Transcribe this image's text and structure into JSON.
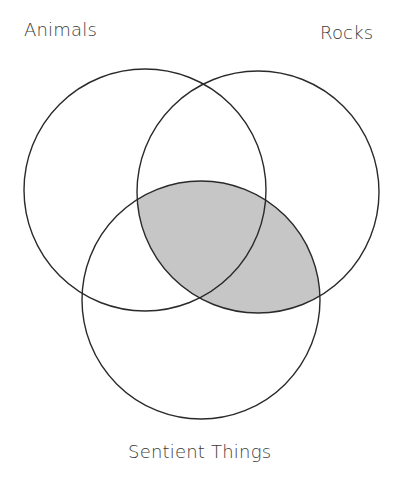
{
  "diagram": {
    "type": "venn",
    "sets": [
      {
        "id": "animals",
        "label": "Animals",
        "cx": 145,
        "cy": 190,
        "r": 121
      },
      {
        "id": "rocks",
        "label": "Rocks",
        "cx": 258,
        "cy": 192,
        "r": 121
      },
      {
        "id": "sentient",
        "label": "Sentient Things",
        "cx": 201,
        "cy": 300,
        "r": 119
      }
    ],
    "shaded_regions": [
      {
        "sets": [
          "rocks",
          "sentient"
        ],
        "fill": "#c6c6c6"
      }
    ],
    "stroke_color": "#2a2a2a",
    "background": "#ffffff"
  },
  "labels": {
    "animals": "Animals",
    "rocks": "Rocks",
    "sentient": "Sentient Things"
  }
}
